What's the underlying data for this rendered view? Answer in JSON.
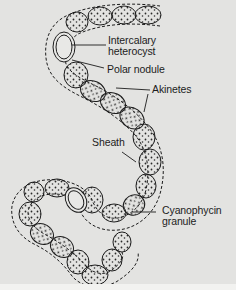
{
  "figure": {
    "background_color": "#e3e3e1",
    "line_color": "#1c1c1c",
    "labels": [
      {
        "id": "intercalary-heterocyst",
        "lines": [
          "Intercalary",
          "heterocyst"
        ]
      },
      {
        "id": "polar-nodule",
        "lines": [
          "Polar nodule"
        ]
      },
      {
        "id": "akinetes",
        "lines": [
          "Akinetes"
        ]
      },
      {
        "id": "sheath",
        "lines": [
          "Sheath"
        ]
      },
      {
        "id": "cyanophycin-granule",
        "lines": [
          "Cyanophycin",
          "granule"
        ]
      }
    ]
  }
}
